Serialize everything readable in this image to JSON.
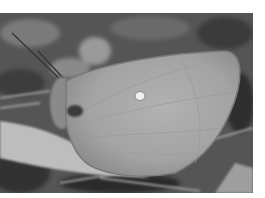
{
  "image": {
    "subject": "butterfly resting on dry leaves",
    "color_mode": "grayscale",
    "colors": {
      "background": "#ffffff",
      "ground_dark": "#2a2a2a",
      "ground_mid": "#6e6e6e",
      "leaf_light": "#bdbdbd",
      "wing": "#a8a8a8",
      "wing_edge": "#7a7a7a",
      "spot": "#efefef"
    }
  }
}
